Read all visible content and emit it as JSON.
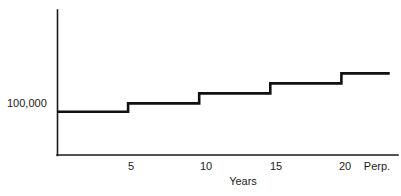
{
  "chart_data": {
    "type": "line",
    "subtype": "step",
    "title": "",
    "xlabel": "Years",
    "ylabel": "",
    "grid": false,
    "legend": null,
    "xlim": [
      0,
      23.7
    ],
    "ylim": [
      0,
      3.35
    ],
    "x_tick_labels": [
      "5",
      "10",
      "15",
      "20",
      "Perp."
    ],
    "x_tick_values": [
      5,
      10,
      15,
      20,
      22.2
    ],
    "y_tick_labels": [
      "100,000"
    ],
    "y_tick_values": [
      1.0
    ],
    "annotations": [],
    "series": [
      {
        "name": "Value",
        "step_mode": "post",
        "x": [
          0,
          5,
          10,
          15,
          20,
          23.4
        ],
        "values": [
          1.0,
          1.192,
          1.423,
          1.654,
          1.885,
          1.885
        ]
      }
    ],
    "steps": [
      {
        "from_year": 0,
        "to_year": 5,
        "level_label": "100,000"
      },
      {
        "from_year": 5,
        "to_year": 10,
        "level_label": ""
      },
      {
        "from_year": 10,
        "to_year": 15,
        "level_label": ""
      },
      {
        "from_year": 15,
        "to_year": 20,
        "level_label": ""
      },
      {
        "from_year": 20,
        "to_year": 23.4,
        "level_label": ""
      }
    ],
    "colors": {
      "line": "#111111",
      "axis": "#1a1a1a",
      "background": "#ffffff",
      "text": "#1a1a1a"
    }
  },
  "axes": {
    "y_axis_label_value": "100,000",
    "x_axis_title": "Years"
  },
  "ticks": {
    "x": [
      {
        "label": "5"
      },
      {
        "label": "10"
      },
      {
        "label": "15"
      },
      {
        "label": "20"
      },
      {
        "label": "Perp."
      }
    ]
  }
}
